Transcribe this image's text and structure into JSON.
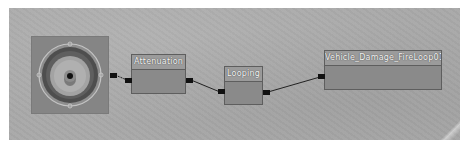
{
  "editor": {
    "canvas_background": "#a9a9a9",
    "output_node": {
      "icon": "speaker-icon"
    },
    "nodes": [
      {
        "id": "attenuation",
        "title": "Attenuation"
      },
      {
        "id": "looping",
        "title": "Looping"
      },
      {
        "id": "wave",
        "title": "Vehicle_Damage_FireLoop01"
      }
    ],
    "connections": [
      {
        "from": "output",
        "to": "attenuation"
      },
      {
        "from": "attenuation",
        "to": "looping"
      },
      {
        "from": "looping",
        "to": "wave"
      }
    ]
  }
}
